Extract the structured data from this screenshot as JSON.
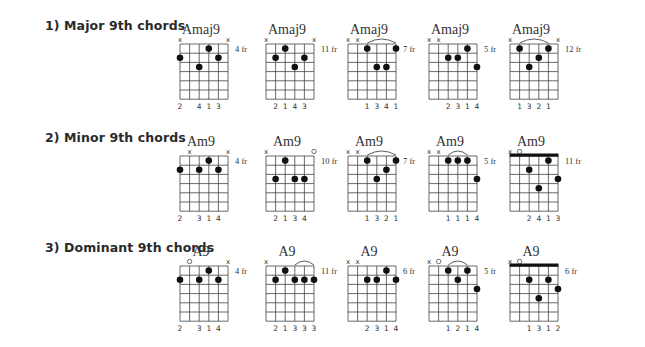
{
  "sections": [
    {
      "title": "1) Major 9th chords",
      "top": 18,
      "chords": [
        {
          "name": "Amaj9",
          "fret": "4 fr",
          "markers": [
            "x",
            "",
            "",
            "",
            "",
            "x"
          ],
          "barre": null,
          "nut": false,
          "dots": [
            [
              1,
              2
            ],
            [
              3,
              3
            ],
            [
              4,
              1
            ],
            [
              5,
              2
            ]
          ],
          "fingers": [
            "2",
            "",
            "4",
            "1",
            "3",
            ""
          ]
        },
        {
          "name": "Amaj9",
          "fret": "11 fr",
          "markers": [
            "x",
            "",
            "",
            "",
            "",
            "x"
          ],
          "barre": null,
          "nut": false,
          "dots": [
            [
              2,
              2
            ],
            [
              3,
              1
            ],
            [
              4,
              3
            ],
            [
              5,
              2
            ]
          ],
          "fingers": [
            "",
            "2",
            "1",
            "4",
            "3",
            ""
          ]
        },
        {
          "name": "Amaj9",
          "fret": "7 fr",
          "markers": [
            "x",
            "x",
            "",
            "",
            "",
            ""
          ],
          "barre": [
            3,
            6
          ],
          "nut": false,
          "dots": [
            [
              3,
              1
            ],
            [
              4,
              3
            ],
            [
              5,
              3
            ],
            [
              6,
              1
            ]
          ],
          "fingers": [
            "",
            "",
            "1",
            "3",
            "4",
            "1"
          ]
        },
        {
          "name": "Amaj9",
          "fret": "5 fr",
          "markers": [
            "x",
            "x",
            "",
            "",
            "",
            ""
          ],
          "barre": null,
          "nut": false,
          "dots": [
            [
              3,
              2
            ],
            [
              4,
              2
            ],
            [
              5,
              1
            ],
            [
              6,
              3
            ]
          ],
          "fingers": [
            "",
            "",
            "2",
            "3",
            "1",
            "4"
          ]
        },
        {
          "name": "Amaj9",
          "fret": "12 fr",
          "markers": [
            "x",
            "",
            "",
            "",
            "",
            "x"
          ],
          "barre": [
            2,
            5
          ],
          "nut": false,
          "dots": [
            [
              2,
              1
            ],
            [
              3,
              3
            ],
            [
              4,
              2
            ],
            [
              5,
              1
            ]
          ],
          "fingers": [
            "",
            "1",
            "3",
            "2",
            "1",
            ""
          ]
        }
      ]
    },
    {
      "title": "2) Minor 9th chords",
      "top": 130,
      "chords": [
        {
          "name": "Am9",
          "fret": "4 fr",
          "markers": [
            "",
            "x",
            "",
            "",
            "",
            "x"
          ],
          "barre": null,
          "nut": false,
          "dots": [
            [
              1,
              2
            ],
            [
              3,
              2
            ],
            [
              4,
              1
            ],
            [
              5,
              2
            ]
          ],
          "fingers": [
            "2",
            "",
            "3",
            "1",
            "4",
            ""
          ]
        },
        {
          "name": "Am9",
          "fret": "10 fr",
          "markers": [
            "x",
            "",
            "",
            "",
            "",
            "o"
          ],
          "barre": null,
          "nut": false,
          "dots": [
            [
              2,
              3
            ],
            [
              3,
              1
            ],
            [
              4,
              3
            ],
            [
              5,
              3
            ]
          ],
          "fingers": [
            "",
            "2",
            "1",
            "3",
            "4",
            ""
          ]
        },
        {
          "name": "Am9",
          "fret": "7 fr",
          "markers": [
            "x",
            "x",
            "",
            "",
            "",
            ""
          ],
          "barre": [
            3,
            6
          ],
          "nut": false,
          "dots": [
            [
              3,
              1
            ],
            [
              4,
              3
            ],
            [
              5,
              2
            ],
            [
              6,
              1
            ]
          ],
          "fingers": [
            "",
            "",
            "1",
            "3",
            "2",
            "1"
          ]
        },
        {
          "name": "Am9",
          "fret": "5 fr",
          "markers": [
            "x",
            "x",
            "",
            "",
            "",
            ""
          ],
          "barre": [
            3,
            5
          ],
          "nut": false,
          "dots": [
            [
              3,
              1
            ],
            [
              4,
              1
            ],
            [
              5,
              1
            ],
            [
              6,
              3
            ]
          ],
          "fingers": [
            "",
            "",
            "1",
            "1",
            "1",
            "4"
          ]
        },
        {
          "name": "Am9",
          "fret": "11 fr",
          "markers": [
            "x",
            "o",
            "",
            "",
            "",
            ""
          ],
          "barre": null,
          "nut": true,
          "dots": [
            [
              3,
              2
            ],
            [
              4,
              4
            ],
            [
              5,
              1
            ],
            [
              6,
              3
            ]
          ],
          "fingers": [
            "",
            "",
            "2",
            "4",
            "1",
            "3"
          ]
        }
      ]
    },
    {
      "title": "3) Dominant 9th chords",
      "top": 240,
      "chords": [
        {
          "name": "A9",
          "fret": "4 fr",
          "markers": [
            "",
            "o",
            "",
            "",
            "",
            "x"
          ],
          "barre": null,
          "nut": false,
          "dots": [
            [
              1,
              2
            ],
            [
              3,
              2
            ],
            [
              4,
              1
            ],
            [
              5,
              2
            ]
          ],
          "fingers": [
            "2",
            "",
            "3",
            "1",
            "4",
            ""
          ]
        },
        {
          "name": "A9",
          "fret": "11 fr",
          "markers": [
            "x",
            "",
            "",
            "",
            "",
            ""
          ],
          "barre": [
            4,
            6
          ],
          "nut": false,
          "dots": [
            [
              2,
              2
            ],
            [
              3,
              1
            ],
            [
              4,
              2
            ],
            [
              5,
              2
            ],
            [
              6,
              2
            ]
          ],
          "fingers": [
            "",
            "2",
            "1",
            "3",
            "3",
            "3"
          ]
        },
        {
          "name": "A9",
          "fret": "6 fr",
          "markers": [
            "x",
            "x",
            "",
            "",
            "",
            ""
          ],
          "barre": null,
          "nut": false,
          "dots": [
            [
              3,
              2
            ],
            [
              4,
              2
            ],
            [
              5,
              1
            ],
            [
              6,
              2
            ]
          ],
          "fingers": [
            "",
            "",
            "2",
            "3",
            "1",
            "4"
          ]
        },
        {
          "name": "A9",
          "fret": "5 fr",
          "markers": [
            "x",
            "o",
            "",
            "",
            "",
            ""
          ],
          "barre": [
            3,
            5
          ],
          "nut": false,
          "dots": [
            [
              3,
              1
            ],
            [
              4,
              2
            ],
            [
              5,
              1
            ],
            [
              6,
              3
            ]
          ],
          "fingers": [
            "",
            "",
            "1",
            "2",
            "1",
            "4"
          ]
        },
        {
          "name": "A9",
          "fret": "6 fr",
          "markers": [
            "x",
            "o",
            "",
            "",
            "",
            ""
          ],
          "barre": null,
          "nut": true,
          "dots": [
            [
              3,
              2
            ],
            [
              4,
              4
            ],
            [
              5,
              2
            ],
            [
              6,
              3
            ]
          ],
          "fingers": [
            "",
            "",
            "1",
            "3",
            "1",
            "2"
          ]
        }
      ]
    }
  ],
  "layout": {
    "column_x": [
      172,
      258,
      340,
      421,
      502
    ]
  }
}
